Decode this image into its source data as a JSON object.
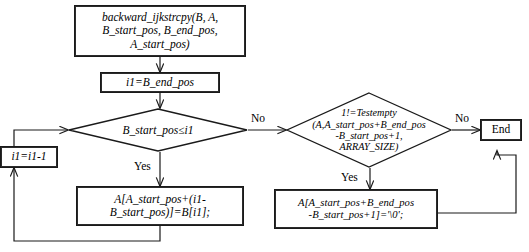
{
  "diagram": {
    "type": "flowchart",
    "title_text": "",
    "colors": {
      "stroke": "#1a1a1a",
      "background": "#ffffff",
      "text": "#000000"
    },
    "nodes": {
      "entry": {
        "shape": "process-box",
        "label": "backward_ijkstrcpy(B, A,\nB_start_pos, B_end_pos,\nA_start_pos)"
      },
      "init": {
        "shape": "process-box",
        "label": "i1=B_end_pos"
      },
      "loop_cond": {
        "shape": "decision-diamond",
        "label": "B_start_pos≤i1"
      },
      "decrement": {
        "shape": "process-box",
        "label": "i1=i1-1"
      },
      "copy_char": {
        "shape": "process-box",
        "label": "A[A_start_pos+(i1-\nB_start_pos)]=B[i1];"
      },
      "testempty_cond": {
        "shape": "decision-diamond",
        "label": "1!=Testempty\n(A,A_start_pos+B_end_pos\n-B_start_pos+1,\nARRAY_SIZE)"
      },
      "terminate_string": {
        "shape": "process-box",
        "label": "A[A_start_pos+B_end_pos\n-B_start_pos+1]='\\0';"
      },
      "end": {
        "shape": "process-box",
        "label": "End"
      }
    },
    "edge_labels": {
      "loop_cond_no": "No",
      "loop_cond_yes": "Yes",
      "testempty_no": "No",
      "testempty_yes": "Yes"
    }
  }
}
